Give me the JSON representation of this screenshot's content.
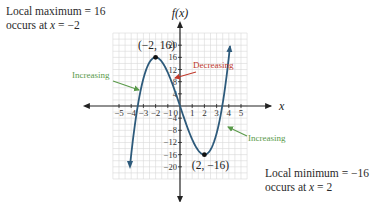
{
  "annotations": {
    "max_line1": "Local maximum = 16",
    "max_line2_prefix": "occurs at ",
    "max_line2_var": "x",
    "max_line2_suffix": " = −2",
    "min_line1": "Local minimum = −16",
    "min_line2_prefix": "occurs at ",
    "min_line2_var": "x",
    "min_line2_suffix": " = 2",
    "increasing_left": "Increasing",
    "increasing_right": "Increasing",
    "decreasing": "Decreasing",
    "point_max": "(−2, 16)",
    "point_min": "(2, −16)"
  },
  "colors": {
    "curve": "#2d5a7b",
    "increasing": "#5a9a4a",
    "decreasing": "#c0392b",
    "grid": "#d9d9d9",
    "axis": "#222222"
  },
  "chart_data": {
    "type": "line",
    "title": "",
    "function": "f(x) = x^3 - 12x",
    "xlabel": "x",
    "ylabel": "f(x)",
    "xlim": [
      -5.5,
      5.5
    ],
    "ylim": [
      -24,
      24
    ],
    "x_ticks": [
      -5,
      -4,
      -3,
      -2,
      -1,
      0,
      1,
      2,
      3,
      4,
      5
    ],
    "x_tick_labels": [
      "−5",
      "−4",
      "−3",
      "−2",
      "−1",
      "0",
      "1",
      "2",
      "3",
      "4",
      "5"
    ],
    "y_ticks": [
      -20,
      -16,
      -12,
      -8,
      -4,
      4,
      8,
      12,
      16,
      20
    ],
    "y_tick_labels": [
      "−20",
      "−16",
      "−12",
      "−8",
      "−4",
      "4",
      "8",
      "12",
      "16",
      "20"
    ],
    "grid": true,
    "series": [
      {
        "name": "f(x)",
        "x": [
          -4.1,
          -4,
          -3.5,
          -3,
          -2.5,
          -2,
          -1.5,
          -1,
          -0.5,
          0,
          0.5,
          1,
          1.5,
          2,
          2.5,
          3,
          3.5,
          4,
          4.1
        ],
        "y": [
          -19.72,
          -16,
          -0.875,
          9,
          14.375,
          16,
          14.625,
          11,
          5.875,
          0,
          -5.875,
          -11,
          -14.625,
          -16,
          -14.375,
          -9,
          0.875,
          16,
          19.72
        ]
      }
    ],
    "key_points": [
      {
        "label": "(−2, 16)",
        "x": -2,
        "y": 16,
        "type": "local maximum"
      },
      {
        "label": "(2, −16)",
        "x": 2,
        "y": -16,
        "type": "local minimum"
      }
    ],
    "intervals": [
      {
        "label": "Increasing",
        "range": "x < −2"
      },
      {
        "label": "Decreasing",
        "range": "−2 < x < 2"
      },
      {
        "label": "Increasing",
        "range": "x > 2"
      }
    ]
  }
}
